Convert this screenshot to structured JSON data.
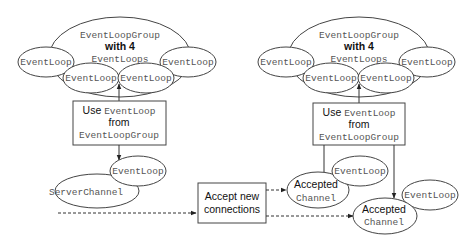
{
  "left_panel": {
    "group": {
      "line1": "EventLoopGroup",
      "line2": "with 4",
      "line3": "EventLoops"
    },
    "loops": [
      "EventLoop",
      "EventLoop",
      "EventLoop",
      "EventLoop"
    ],
    "box": {
      "use": "Use ",
      "use_code": "EventLoop",
      "from": "from",
      "group_code": "EventLoopGroup"
    },
    "assigned_loop": "EventLoop",
    "channel": "ServerChannel"
  },
  "center": {
    "accept_line1": "Accept new",
    "accept_line2": "connections"
  },
  "right_panel": {
    "group": {
      "line1": "EventLoopGroup",
      "line2": "with 4",
      "line3": "EventLoops"
    },
    "loops": [
      "EventLoop",
      "EventLoop",
      "EventLoop",
      "EventLoop"
    ],
    "box": {
      "use": "Use ",
      "use_code": "EventLoop",
      "from": "from",
      "group_code": "EventLoopGroup"
    },
    "channels": [
      {
        "loop": "EventLoop",
        "label1": "Accepted",
        "label2": "Channel"
      },
      {
        "loop": "EventLoop",
        "label1": "Accepted",
        "label2": "Channel"
      }
    ]
  }
}
